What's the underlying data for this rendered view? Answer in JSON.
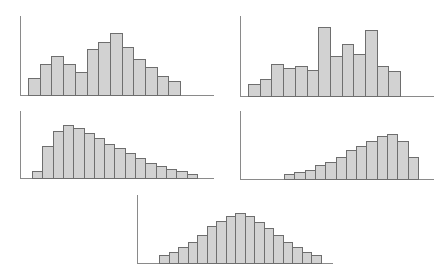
{
  "chart_data": [
    {
      "type": "bar",
      "title": "",
      "xlabel": "",
      "ylabel": "",
      "description": "Bimodal histogram",
      "values": [
        17,
        31,
        39,
        31,
        23,
        46,
        53,
        62,
        48,
        36,
        28,
        19,
        14
      ],
      "layout": {
        "axis_x": 20,
        "axis_top": 16,
        "baseline": 95,
        "axis_right": 214,
        "bar_start": 28,
        "bar_width": 11.7
      }
    },
    {
      "type": "bar",
      "title": "",
      "xlabel": "",
      "ylabel": "",
      "description": "Irregular/multimodal histogram",
      "values": [
        12,
        17,
        32,
        28,
        30,
        26,
        69,
        40,
        52,
        42,
        66,
        30,
        25
      ],
      "layout": {
        "axis_x": 240,
        "axis_top": 16,
        "baseline": 96,
        "axis_right": 434,
        "bar_start": 248,
        "bar_width": 11.7
      }
    },
    {
      "type": "bar",
      "title": "",
      "xlabel": "",
      "ylabel": "",
      "description": "Right-skewed histogram",
      "values": [
        7,
        32,
        47,
        53,
        50,
        45,
        40,
        34,
        30,
        25,
        20,
        15,
        12,
        9,
        7,
        4
      ],
      "layout": {
        "axis_x": 20,
        "axis_top": 111,
        "baseline": 178,
        "axis_right": 214,
        "bar_start": 32,
        "bar_width": 10.3
      }
    },
    {
      "type": "bar",
      "title": "",
      "xlabel": "",
      "ylabel": "",
      "description": "Left-skewed histogram",
      "values": [
        5,
        7,
        9,
        14,
        17,
        22,
        29,
        33,
        38,
        43,
        45,
        38,
        22
      ],
      "layout": {
        "axis_x": 240,
        "axis_top": 111,
        "baseline": 179,
        "axis_right": 434,
        "bar_start": 284,
        "bar_width": 10.3
      }
    },
    {
      "type": "bar",
      "title": "",
      "xlabel": "",
      "ylabel": "",
      "description": "Symmetric (bell-shaped) histogram",
      "values": [
        8,
        11,
        16,
        21,
        28,
        37,
        42,
        47,
        50,
        47,
        41,
        35,
        28,
        21,
        16,
        11,
        8
      ],
      "layout": {
        "axis_x": 137,
        "axis_top": 195,
        "baseline": 263,
        "axis_right": 333,
        "bar_start": 159,
        "bar_width": 9.5
      }
    }
  ],
  "colors": {
    "bar_fill": "#d2d2d2",
    "bar_border": "#6e6e6e",
    "axis": "#8a8a8a",
    "background": "#ffffff"
  }
}
